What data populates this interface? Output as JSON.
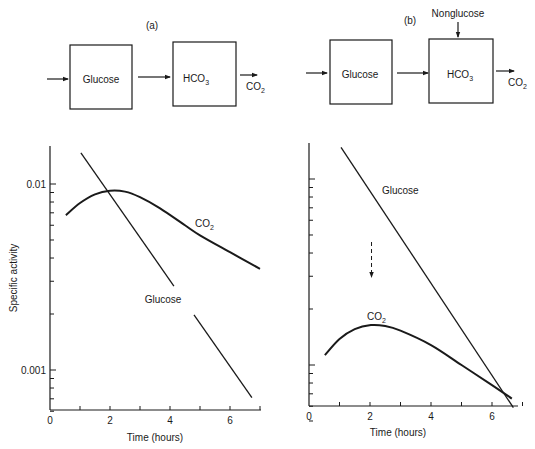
{
  "diagrams": [
    {
      "panel_label": "(a)",
      "pool1": "Glucose",
      "pool2_base": "HCO",
      "pool2_sub": "3",
      "output_base": "CO",
      "output_sub": "2"
    },
    {
      "panel_label": "(b)",
      "pool1": "Glucose",
      "pool2_base": "HCO",
      "pool2_sub": "3",
      "output_base": "CO",
      "output_sub": "2",
      "extra_input": "Nonglucose"
    }
  ],
  "chart_data": [
    {
      "type": "line",
      "panel": "a",
      "title": "",
      "xlabel": "Time (hours)",
      "ylabel": "Specific activity",
      "yscale": "log",
      "xlim": [
        0,
        7
      ],
      "ylim": [
        0.0006,
        0.016
      ],
      "x_ticks": [
        0,
        1,
        2,
        3,
        4,
        5,
        6,
        7
      ],
      "x_tick_labels": [
        "0",
        "2",
        "4",
        "6"
      ],
      "x_tick_label_values": [
        0,
        2,
        4,
        6
      ],
      "y_tick_labels": [
        "0.01",
        "0.001"
      ],
      "y_tick_label_values": [
        0.01,
        0.001
      ],
      "grid": false,
      "series": [
        {
          "name": "Glucose",
          "label": "Glucose",
          "x": [
            1.03,
            6.73
          ],
          "y": [
            0.0147,
            0.00071
          ],
          "gap_x": [
            4.13,
            4.8
          ]
        },
        {
          "name": "CO2",
          "label_base": "CO",
          "label_sub": "2",
          "x": [
            0.53,
            1.0,
            1.5,
            2.0,
            2.5,
            3.0,
            3.67,
            4.5,
            5.0,
            6.0,
            7.0
          ],
          "y": [
            0.0068,
            0.0079,
            0.0088,
            0.0092,
            0.0091,
            0.0085,
            0.0074,
            0.006,
            0.0053,
            0.0043,
            0.0035
          ]
        }
      ]
    },
    {
      "type": "line",
      "panel": "b",
      "title": "",
      "xlabel": "Time (hours)",
      "ylabel": "",
      "yscale": "log",
      "xlim": [
        0,
        7
      ],
      "ylim": [
        0.0005,
        0.016
      ],
      "x_ticks": [
        0,
        1,
        2,
        3,
        4,
        5,
        6,
        7
      ],
      "x_tick_labels": [
        "0",
        "2",
        "4",
        "6"
      ],
      "x_tick_label_values": [
        0,
        2,
        4,
        6
      ],
      "y_tick_labels": [],
      "grid": false,
      "annotation": "dashed downward arrow at t = 2 h between Glucose and CO2",
      "series": [
        {
          "name": "Glucose",
          "label": "Glucose",
          "x": [
            1.05,
            6.7
          ],
          "y": [
            0.0148,
            0.00059
          ]
        },
        {
          "name": "CO2",
          "label_base": "CO",
          "label_sub": "2",
          "x": [
            0.52,
            1.0,
            1.5,
            2.03,
            2.5,
            3.0,
            4.0,
            5.0,
            6.0,
            6.65
          ],
          "y": [
            0.00113,
            0.00138,
            0.00156,
            0.00164,
            0.00162,
            0.00153,
            0.00128,
            0.001,
            0.00078,
            0.00066
          ]
        }
      ]
    }
  ]
}
